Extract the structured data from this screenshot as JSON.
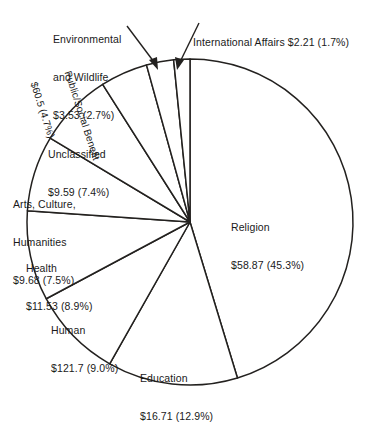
{
  "chart_data": {
    "type": "pie",
    "title": "",
    "subtitle": "",
    "xlabel": "",
    "ylabel": "",
    "legend_position": "none",
    "grid": false,
    "value_unit": "billions of dollars",
    "start_angle_deg": 0,
    "direction": "clockwise",
    "categories": [
      "Religion",
      "Education",
      "Human",
      "Health",
      "Arts, Culture, Humanities",
      "Unclassified",
      "Public/Social Benefit",
      "Environmental and Wildlife",
      "International Affairs"
    ],
    "values": [
      58.87,
      16.71,
      121.7,
      11.53,
      9.68,
      9.59,
      60.5,
      3.53,
      2.21
    ],
    "percents": [
      45.3,
      12.9,
      9.0,
      8.9,
      7.5,
      7.4,
      4.7,
      2.7,
      1.7
    ],
    "slices": [
      {
        "name": "Religion",
        "value": 58.87,
        "value_text": "$58.87",
        "percent": 45.3,
        "percent_text": "(45.3%)",
        "label_line1": "Religion",
        "label_line2": "$58.87 (45.3%)",
        "label_placement": "inside-right",
        "start_deg": 0,
        "end_deg": 163.08
      },
      {
        "name": "Education",
        "value": 16.71,
        "value_text": "$16.71",
        "percent": 12.9,
        "percent_text": "(12.9%)",
        "label_line1": "Education",
        "label_line2": "$16.71 (12.9%)",
        "label_placement": "inside-bottom",
        "start_deg": 163.08,
        "end_deg": 209.52
      },
      {
        "name": "Human",
        "value": 121.7,
        "value_text": "$121.7",
        "percent": 9.0,
        "percent_text": "(9.0%)",
        "label_line1": "Human",
        "label_line2": "$121.7 (9.0%)",
        "label_placement": "inside-bottom-left",
        "start_deg": 209.52,
        "end_deg": 241.92
      },
      {
        "name": "Health",
        "value": 11.53,
        "value_text": "$11.53",
        "percent": 8.9,
        "percent_text": "(8.9%)",
        "label_line1": "Health",
        "label_line2": "$11.53 (8.9%)",
        "label_placement": "inside-left",
        "start_deg": 241.92,
        "end_deg": 273.96
      },
      {
        "name": "Arts, Culture, Humanities",
        "value": 9.68,
        "value_text": "$9.68",
        "percent": 7.5,
        "percent_text": "(7.5%)",
        "label_line1": "Arts, Culture,",
        "label_line2": "Humanities",
        "label_line3": "$9.68 (7.5%)",
        "label_placement": "inside-left",
        "start_deg": 273.96,
        "end_deg": 300.96
      },
      {
        "name": "Unclassified",
        "value": 9.59,
        "value_text": "$9.59",
        "percent": 7.4,
        "percent_text": "(7.4%)",
        "label_line1": "Unclassified",
        "label_line2": "$9.59 (7.4%)",
        "label_placement": "inside-upper-left",
        "start_deg": 300.96,
        "end_deg": 327.6
      },
      {
        "name": "Public/Social Benefit",
        "value": 60.5,
        "value_text": "$60.5",
        "percent": 4.7,
        "percent_text": "(4.7%)",
        "label_line1": "Public/Social Benefit",
        "label_line2": "$60.5 (4.7%)",
        "label_placement": "rotated-in-slice",
        "start_deg": 327.6,
        "end_deg": 344.52
      },
      {
        "name": "Environmental and Wildlife",
        "value": 3.53,
        "value_text": "$3.53",
        "percent": 2.7,
        "percent_text": "(2.7%)",
        "label_line1": "Environmental",
        "label_line2": "and Wildlife",
        "label_line3": "$3.53 (2.7%)",
        "label_placement": "callout-top-left",
        "start_deg": 344.52,
        "end_deg": 354.24
      },
      {
        "name": "International Affairs",
        "value": 2.21,
        "value_text": "$2.21",
        "percent": 1.7,
        "percent_text": "(1.7%)",
        "label_line1": "International Affairs $2.21 (1.7%)",
        "label_placement": "callout-top-right",
        "start_deg": 354.24,
        "end_deg": 360
      }
    ]
  },
  "colors": {
    "background": "#ffffff",
    "stroke": "#23211f",
    "text": "#1a1a1a",
    "slice_fill": "#ffffff"
  }
}
